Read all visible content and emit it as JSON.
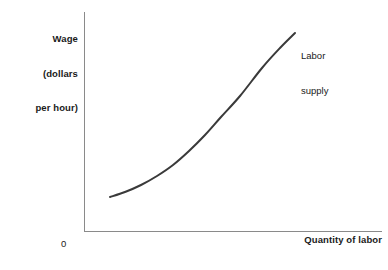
{
  "chart_data": {
    "type": "line",
    "title": "",
    "subtitle": "",
    "ylabel_lines": [
      "Wage",
      "(dollars",
      "per hour)"
    ],
    "ylabel": "Wage (dollars per hour)",
    "xlabel": "Quantity of labor",
    "origin_label": "0",
    "grid": false,
    "legend_position": "inline-end-of-curve",
    "xlim": [
      0,
      100
    ],
    "ylim": [
      0,
      100
    ],
    "xticks": [],
    "yticks": [],
    "xticklabels": [],
    "yticklabels": [],
    "annotations": [
      {
        "text": "Labor supply",
        "lines": [
          "Labor",
          "supply"
        ],
        "attached_to": "labor-supply",
        "position": "upper-right"
      }
    ],
    "series": [
      {
        "name": "Labor supply",
        "label_lines": [
          "Labor",
          "supply"
        ],
        "color": "#3a3a3a",
        "linewidth": 2,
        "style": "solid",
        "shape": "convex-increasing",
        "x": [
          14,
          22,
          31,
          40,
          49,
          58,
          67,
          76,
          85,
          94,
          100
        ],
        "y": [
          16,
          19,
          23,
          28,
          34,
          42,
          51,
          62,
          74,
          86,
          93
        ],
        "points_px": [
          [
            110,
            197
          ],
          [
            125,
            192
          ],
          [
            141,
            185
          ],
          [
            157,
            176
          ],
          [
            173,
            165
          ],
          [
            189,
            151
          ],
          [
            205,
            135
          ],
          [
            221,
            117
          ],
          [
            240,
            96
          ],
          [
            262,
            68
          ],
          [
            280,
            48
          ],
          [
            295,
            33
          ]
        ]
      }
    ]
  },
  "axes": {
    "yaxis_color": "#8a8a8a",
    "xaxis_color": "#8a8a8a",
    "axis_width": 1
  },
  "colors": {
    "background": "#ffffff",
    "curve": "#3a3a3a",
    "text": "#1a1a1a",
    "axis": "#8a8a8a"
  }
}
